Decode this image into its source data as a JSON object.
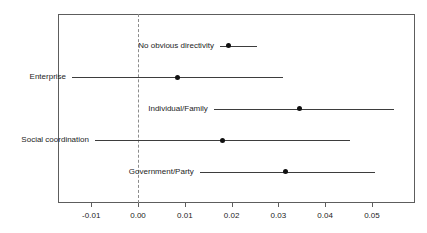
{
  "chart_data": {
    "type": "scatter",
    "subtype": "forest-plot",
    "title": "",
    "xlabel": "",
    "ylabel": "",
    "xlim": [
      -0.0171,
      0.0592
    ],
    "ylim": [
      0,
      5
    ],
    "grid": false,
    "legend": null,
    "zero_reference_line": 0.0,
    "x_ticks": [
      -0.01,
      0.0,
      0.01,
      0.02,
      0.03,
      0.04,
      0.05
    ],
    "x_tick_labels": [
      "-0.01",
      "0.00",
      "0.01",
      "0.02",
      "0.03",
      "0.04",
      "0.05"
    ],
    "categories": [
      "No obvious directivity",
      "Enterprise",
      "Individual/Family",
      "Social coordination",
      "Government/Party"
    ],
    "values": [
      0.0193,
      0.0085,
      0.0345,
      0.018,
      0.0316
    ],
    "ci_low": [
      0.0175,
      -0.0141,
      0.0162,
      -0.0092,
      0.0132
    ],
    "ci_high": [
      0.0255,
      0.031,
      0.0547,
      0.0453,
      0.0506
    ],
    "points": [
      {
        "label": "No obvious directivity",
        "estimate": 0.0193,
        "ci_low": 0.0175,
        "ci_high": 0.0255,
        "label_side": "left"
      },
      {
        "label": "Enterprise",
        "estimate": 0.0085,
        "ci_low": -0.0141,
        "ci_high": 0.031,
        "label_side": "left"
      },
      {
        "label": "Individual/Family",
        "estimate": 0.0345,
        "ci_low": 0.0162,
        "ci_high": 0.0547,
        "label_side": "left"
      },
      {
        "label": "Social coordination",
        "estimate": 0.018,
        "ci_low": -0.0092,
        "ci_high": 0.0453,
        "label_side": "left"
      },
      {
        "label": "Government/Party",
        "estimate": 0.0316,
        "ci_low": 0.0132,
        "ci_high": 0.0506,
        "label_side": "left"
      }
    ],
    "colors": {
      "point": "#111111",
      "interval": "#3d3d3d",
      "zero_line": "#8c8c8c",
      "frame": "#5d5d5d",
      "text": "#242424",
      "background": "#ffffff"
    }
  }
}
